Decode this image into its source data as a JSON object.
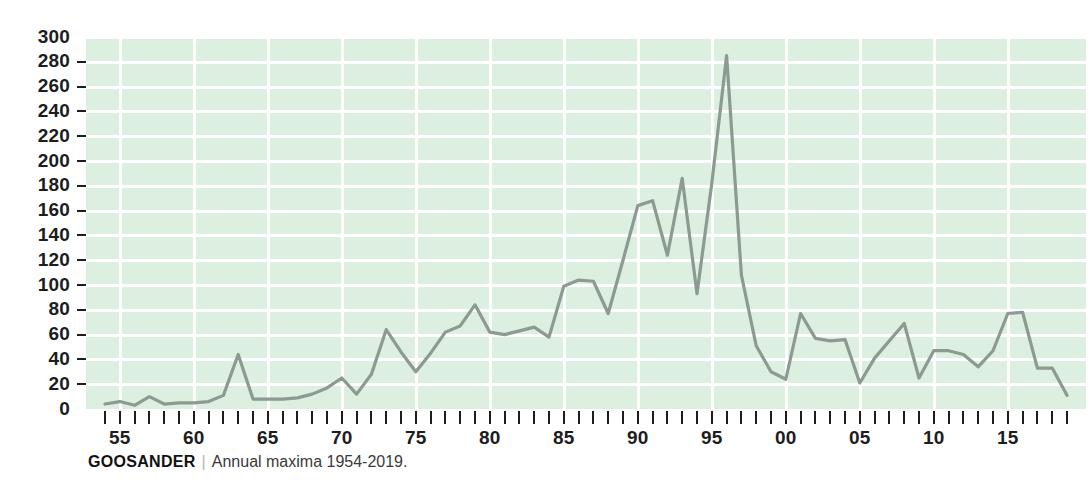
{
  "caption": {
    "species": "GOOSANDER",
    "divider": "|",
    "subtitle": "Annual maxima 1954-2019."
  },
  "colors": {
    "plot_background": "#dcefe0",
    "gridline": "#ffffff",
    "line": "#8c9a92",
    "text": "#1d1d1d"
  },
  "chart_data": {
    "type": "line",
    "title": "GOOSANDER",
    "subtitle": "Annual maxima 1954-2019.",
    "xlabel": "",
    "ylabel": "",
    "ylim": [
      0,
      300
    ],
    "xlim": [
      1954,
      2019
    ],
    "grid": true,
    "legend_position": "none",
    "ytick_values": [
      0,
      20,
      40,
      60,
      80,
      100,
      120,
      140,
      160,
      180,
      200,
      220,
      240,
      260,
      280,
      300
    ],
    "ytick_labels": [
      "0",
      "20",
      "40",
      "60",
      "80",
      "100",
      "120",
      "140",
      "160",
      "180",
      "200",
      "220",
      "240",
      "260",
      "280",
      "300"
    ],
    "xtick_years": [
      1954,
      1955,
      1956,
      1957,
      1958,
      1959,
      1960,
      1961,
      1962,
      1963,
      1964,
      1965,
      1966,
      1967,
      1968,
      1969,
      1970,
      1971,
      1972,
      1973,
      1974,
      1975,
      1976,
      1977,
      1978,
      1979,
      1980,
      1981,
      1982,
      1983,
      1984,
      1985,
      1986,
      1987,
      1988,
      1989,
      1990,
      1991,
      1992,
      1993,
      1994,
      1995,
      1996,
      1997,
      1998,
      1999,
      2000,
      2001,
      2002,
      2003,
      2004,
      2005,
      2006,
      2007,
      2008,
      2009,
      2010,
      2011,
      2012,
      2013,
      2014,
      2015,
      2016,
      2017,
      2018,
      2019
    ],
    "xtick_labels": [
      {
        "year": 1955,
        "label": "55"
      },
      {
        "year": 1960,
        "label": "60"
      },
      {
        "year": 1965,
        "label": "65"
      },
      {
        "year": 1970,
        "label": "70"
      },
      {
        "year": 1975,
        "label": "75"
      },
      {
        "year": 1980,
        "label": "80"
      },
      {
        "year": 1985,
        "label": "85"
      },
      {
        "year": 1990,
        "label": "90"
      },
      {
        "year": 1995,
        "label": "95"
      },
      {
        "year": 2000,
        "label": "00"
      },
      {
        "year": 2005,
        "label": "05"
      },
      {
        "year": 2010,
        "label": "10"
      },
      {
        "year": 2015,
        "label": "15"
      }
    ],
    "x": [
      1954,
      1955,
      1956,
      1957,
      1958,
      1959,
      1960,
      1961,
      1962,
      1963,
      1964,
      1965,
      1966,
      1967,
      1968,
      1969,
      1970,
      1971,
      1972,
      1973,
      1974,
      1975,
      1976,
      1977,
      1978,
      1979,
      1980,
      1981,
      1982,
      1983,
      1984,
      1985,
      1986,
      1987,
      1988,
      1989,
      1990,
      1991,
      1992,
      1993,
      1994,
      1995,
      1996,
      1997,
      1998,
      1999,
      2000,
      2001,
      2002,
      2003,
      2004,
      2005,
      2006,
      2007,
      2008,
      2009,
      2010,
      2011,
      2012,
      2013,
      2014,
      2015,
      2016,
      2017,
      2018,
      2019
    ],
    "values": [
      4,
      6,
      3,
      10,
      4,
      5,
      5,
      6,
      11,
      44,
      8,
      8,
      8,
      9,
      12,
      17,
      25,
      12,
      28,
      64,
      46,
      30,
      45,
      62,
      67,
      84,
      62,
      60,
      63,
      66,
      58,
      99,
      104,
      103,
      77,
      120,
      164,
      168,
      124,
      186,
      93,
      182,
      285,
      108,
      51,
      30,
      24,
      77,
      57,
      55,
      56,
      21,
      41,
      55,
      69,
      25,
      47,
      47,
      44,
      34,
      47,
      77,
      78,
      33,
      33,
      11
    ],
    "series": [
      {
        "name": "Annual maxima",
        "color": "#8c9a92",
        "values": [
          4,
          6,
          3,
          10,
          4,
          5,
          5,
          6,
          11,
          44,
          8,
          8,
          8,
          9,
          12,
          17,
          25,
          12,
          28,
          64,
          46,
          30,
          45,
          62,
          67,
          84,
          62,
          60,
          63,
          66,
          58,
          99,
          104,
          103,
          77,
          120,
          164,
          168,
          124,
          186,
          93,
          182,
          285,
          108,
          51,
          30,
          24,
          77,
          57,
          55,
          56,
          21,
          41,
          55,
          69,
          25,
          47,
          47,
          44,
          34,
          47,
          77,
          78,
          33,
          33,
          11
        ]
      }
    ],
    "annotations": [
      {
        "text": "Peak 285 in 1996"
      }
    ]
  }
}
